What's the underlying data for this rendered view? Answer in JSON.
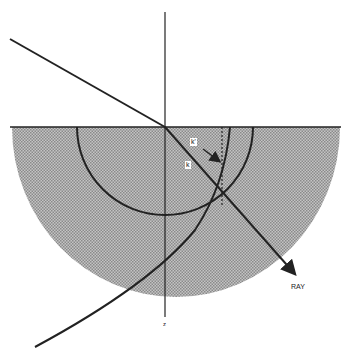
{
  "diagram": {
    "labels": {
      "k_prime": "k'",
      "k": "k",
      "ray": "RAY",
      "z_axis": "z"
    },
    "colors": {
      "line": "#222222",
      "shade": "#a8a8a8",
      "background": "#ffffff"
    }
  }
}
